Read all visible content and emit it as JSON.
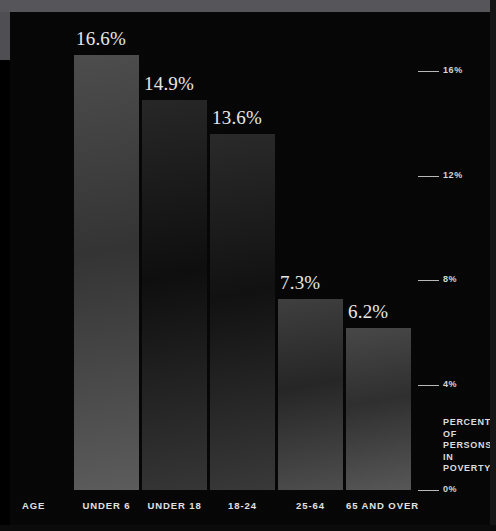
{
  "chart_data": {
    "type": "bar",
    "title": "",
    "subtitle": "",
    "xlabel": "AGE",
    "ylabel": "PERCENT OF PERSONS IN POVERTY",
    "categories": [
      "UNDER 6",
      "UNDER 18",
      "18-24",
      "25-64",
      "65 AND OVER"
    ],
    "values": [
      16.6,
      14.9,
      13.6,
      7.3,
      6.2
    ],
    "data_labels": [
      "16.6%",
      "14.9%",
      "13.6%",
      "7.3%",
      "6.2%"
    ],
    "ylim": [
      0,
      18
    ],
    "yticks": [
      0,
      4,
      8,
      12,
      16
    ],
    "ytick_labels": [
      "0%",
      "4%",
      "8%",
      "12%",
      "16%"
    ],
    "grid": false,
    "legend": "none",
    "axis_position": "right",
    "bar_colors": [
      "#4d4d4d",
      "#272727",
      "#2a2a2a",
      "#3f3f3f",
      "#484848"
    ],
    "background_color": "#060606",
    "label_color": "#e9e9e9"
  },
  "axis": {
    "caption_lines": [
      "PERCENT",
      "OF",
      "PERSONS",
      "IN",
      "POVERTY"
    ],
    "caption_text": "PERCENT OF PERSONS IN POVERTY"
  },
  "xaxis": {
    "name_label": "AGE"
  }
}
